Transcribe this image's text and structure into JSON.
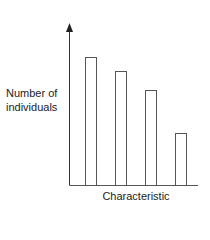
{
  "chart_data": {
    "type": "bar",
    "title": "",
    "xlabel": "Characteristic",
    "ylabel": "Number of individuals",
    "categories": [
      "1",
      "2",
      "3",
      "4"
    ],
    "values": [
      128,
      114,
      95,
      52
    ],
    "ylim": [
      0,
      161
    ],
    "grid": false,
    "legend": null,
    "bar_style": "outline",
    "bar_color": "#555555",
    "axis_color": "#333333"
  },
  "labels": {
    "ylabel_line1": "Number of",
    "ylabel_line2": "individuals",
    "xlabel": "Characteristic"
  }
}
